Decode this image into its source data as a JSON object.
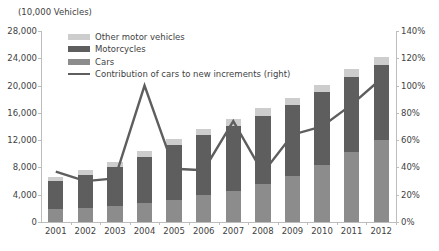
{
  "chart_data": {
    "type": "bar",
    "title": "(10,000 Vehicles)",
    "xlabel": "",
    "ylabel": "(10,000 Vehicles)",
    "y2label": "",
    "categories": [
      "2001",
      "2002",
      "2003",
      "2004",
      "2005",
      "2006",
      "2007",
      "2008",
      "2009",
      "2010",
      "2011",
      "2012"
    ],
    "ylim": [
      0,
      28000
    ],
    "ytick_labels": [
      "0",
      "4,000",
      "8,000",
      "12,000",
      "16,000",
      "20,000",
      "24,000",
      "28,000"
    ],
    "ytick_values": [
      0,
      4000,
      8000,
      12000,
      16000,
      20000,
      24000,
      28000
    ],
    "y2lim": [
      0,
      140
    ],
    "y2tick_labels": [
      "0%",
      "20%",
      "40%",
      "60%",
      "80%",
      "100%",
      "120%",
      "140%"
    ],
    "y2tick_values": [
      0,
      20,
      40,
      60,
      80,
      100,
      120,
      140
    ],
    "grid": false,
    "legend_position": "top-left",
    "series": [
      {
        "name": "Cars",
        "key": "cars",
        "type": "bar",
        "stack": "vehicles",
        "color": "#8c8c8c",
        "axis": "left",
        "values": [
          1850,
          2050,
          2400,
          2800,
          3300,
          3900,
          4600,
          5600,
          6800,
          8400,
          10300,
          12000
        ]
      },
      {
        "name": "Motorcycles",
        "key": "motorcycles",
        "type": "bar",
        "stack": "vehicles",
        "color": "#5e5e5e",
        "axis": "left",
        "values": [
          4100,
          4800,
          5650,
          6800,
          8000,
          8800,
          9500,
          10000,
          10300,
          10600,
          11000,
          11000
        ]
      },
      {
        "name": "Other motor vehicles",
        "key": "other",
        "type": "bar",
        "stack": "vehicles",
        "color": "#cdcdcd",
        "axis": "left",
        "values": [
          700,
          750,
          800,
          850,
          900,
          950,
          1000,
          1050,
          1100,
          1150,
          1200,
          1250
        ]
      },
      {
        "name": "Contribution of cars to new increments (right)",
        "key": "contribution",
        "type": "line",
        "color": "#5e5e5e",
        "axis": "right",
        "unit": "%",
        "values": [
          37,
          30,
          32,
          100,
          39,
          38,
          74,
          36,
          64,
          70,
          86,
          105
        ]
      }
    ],
    "totals": [
      6650,
      7600,
      8850,
      10450,
      12200,
      13650,
      15100,
      16650,
      18200,
      20150,
      22500,
      24250
    ]
  },
  "legend": {
    "items": [
      {
        "label": "Other motor vehicles",
        "swatch": "other"
      },
      {
        "label": "Motorcycles",
        "swatch": "motorcycles"
      },
      {
        "label": "Cars",
        "swatch": "cars"
      },
      {
        "label": "Contribution of cars to new increments (right)",
        "swatch": "line"
      }
    ]
  }
}
